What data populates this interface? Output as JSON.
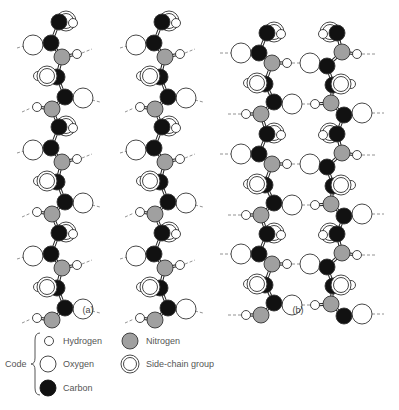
{
  "figure": {
    "panels": [
      {
        "id": "a",
        "label": "(a)"
      },
      {
        "id": "b",
        "label": "(b)"
      }
    ]
  },
  "colors": {
    "hydrogen": "#ffffff",
    "oxygen": "#ffffff",
    "carbon": "#111111",
    "nitrogen": "#a0a0a0",
    "outline": "#333333",
    "hbond": "#777777"
  },
  "legend": {
    "title": "Code",
    "items": [
      {
        "key": "hydrogen",
        "label": "Hydrogen"
      },
      {
        "key": "oxygen",
        "label": "Oxygen"
      },
      {
        "key": "carbon",
        "label": "Carbon"
      },
      {
        "key": "nitrogen",
        "label": "Nitrogen"
      },
      {
        "key": "sidechain",
        "label": "Side-chain group"
      }
    ]
  }
}
